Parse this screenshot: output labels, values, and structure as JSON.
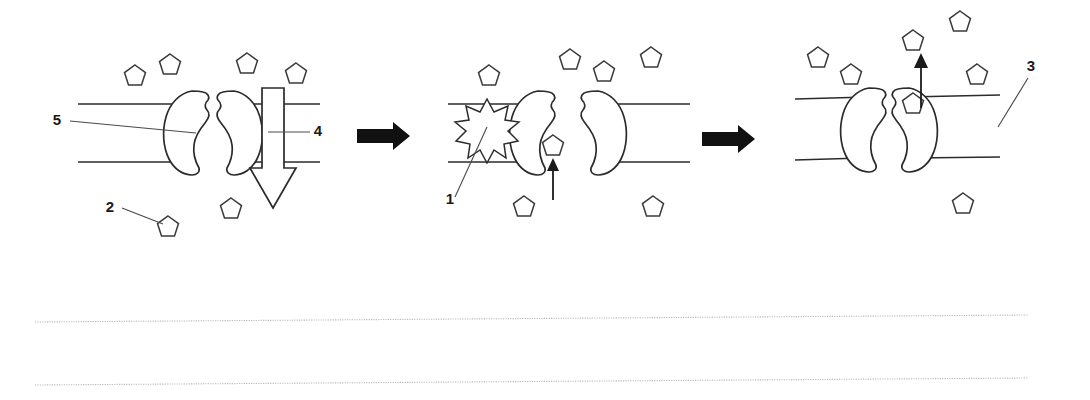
{
  "figure": {
    "background_color": "#ffffff",
    "ink_color": "#2b2b2b",
    "width": 1090,
    "height": 400
  },
  "labels": [
    {
      "id": "label-5",
      "text": "5",
      "x": 57,
      "y": 125,
      "leader_from_x": 70,
      "leader_from_y": 121,
      "leader_to_x": 196,
      "leader_to_y": 133
    },
    {
      "id": "label-4",
      "text": "4",
      "x": 318,
      "y": 136,
      "leader_from_x": 310,
      "leader_from_y": 132,
      "leader_to_x": 268,
      "leader_to_y": 132
    },
    {
      "id": "label-2",
      "text": "2",
      "x": 110,
      "y": 212,
      "leader_from_x": 122,
      "leader_from_y": 208,
      "leader_to_x": 163,
      "leader_to_y": 224
    },
    {
      "id": "label-1",
      "text": "1",
      "x": 450,
      "y": 204,
      "leader_from_x": 455,
      "leader_from_y": 197,
      "leader_to_x": 487,
      "leader_to_y": 127
    },
    {
      "id": "label-3",
      "text": "3",
      "x": 1031,
      "y": 71,
      "leader_from_x": 1028,
      "leader_from_y": 78,
      "leader_to_x": 998,
      "leader_to_y": 127
    }
  ],
  "panels": [
    {
      "id": "panel-1",
      "name": "closed-channel-panel",
      "stage": "closed channel with concentration gradient",
      "membrane": {
        "left": 78,
        "right": 320,
        "top_y": 104,
        "bottom_y": 162
      },
      "channel": {
        "center_x": 213,
        "state": "closed"
      },
      "hollow_arrow": {
        "direction": "down",
        "x": 273,
        "top_y": 88,
        "bottom_y": 208
      },
      "solutes_outside": [
        {
          "x": 135,
          "y": 76
        },
        {
          "x": 170,
          "y": 65
        },
        {
          "x": 247,
          "y": 64
        },
        {
          "x": 296,
          "y": 74
        }
      ],
      "solutes_inside": [
        {
          "x": 231,
          "y": 209
        },
        {
          "x": 168,
          "y": 227
        }
      ]
    },
    {
      "id": "panel-2",
      "name": "open-channel-panel",
      "stage": "stimulus opens the gated channel and solute enters",
      "membrane": {
        "left": 448,
        "right": 690,
        "top_y": 104,
        "bottom_y": 162
      },
      "channel": {
        "center_x": 568,
        "state": "open"
      },
      "burst": {
        "x": 487,
        "y": 126,
        "radius": 27,
        "points": 12
      },
      "solute_in_channel": {
        "x": 553,
        "y": 146
      },
      "entry_arrow": {
        "x": 553,
        "from_y": 200,
        "to_y": 160
      },
      "solutes_outside": [
        {
          "x": 489,
          "y": 76
        },
        {
          "x": 570,
          "y": 60
        },
        {
          "x": 604,
          "y": 72
        },
        {
          "x": 651,
          "y": 58
        }
      ],
      "solutes_inside": [
        {
          "x": 524,
          "y": 207
        },
        {
          "x": 653,
          "y": 207
        }
      ]
    },
    {
      "id": "panel-3",
      "name": "closed-after-transport-panel",
      "stage": "channel closes after the solute is released outside",
      "membrane": {
        "left": 795,
        "right": 1000,
        "top_y": 97,
        "bottom_y": 157
      },
      "channel": {
        "center_x": 888,
        "state": "closed"
      },
      "exit_arrow": {
        "x": 921,
        "from_y": 100,
        "to_y": 56
      },
      "solute_exiting": {
        "x": 913,
        "y": 104
      },
      "solutes_outside": [
        {
          "x": 818,
          "y": 58
        },
        {
          "x": 851,
          "y": 75
        },
        {
          "x": 913,
          "y": 41
        },
        {
          "x": 960,
          "y": 22
        },
        {
          "x": 977,
          "y": 75
        }
      ],
      "solutes_inside": [
        {
          "x": 963,
          "y": 204
        }
      ]
    }
  ],
  "block_arrows": [
    {
      "id": "block-arrow-1",
      "x": 357,
      "y": 126,
      "width": 53,
      "height": 20
    },
    {
      "id": "block-arrow-2",
      "x": 702,
      "y": 129,
      "width": 53,
      "height": 20
    }
  ],
  "ruled_lines": [
    {
      "id": "ruled-line-1",
      "x1": 35,
      "y1": 322,
      "x2": 1028,
      "y2": 315
    },
    {
      "id": "ruled-line-2",
      "x1": 35,
      "y1": 385,
      "x2": 1028,
      "y2": 378
    }
  ]
}
